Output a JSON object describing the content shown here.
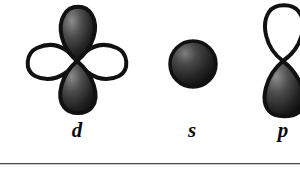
{
  "figure": {
    "background_color": "#ffffff",
    "outline_color": "#111111",
    "fill_dark_color": "#1a1a1a",
    "fill_light_color": "#ffffff",
    "rule_color": "#4a4a4a",
    "orbitals": [
      {
        "id": "d-orbital",
        "label": "d",
        "shape": "four-lobe-clover",
        "lobe_count": 4,
        "lobes": [
          {
            "direction": "up",
            "fill": "dark"
          },
          {
            "direction": "down",
            "fill": "dark"
          },
          {
            "direction": "left",
            "fill": "light"
          },
          {
            "direction": "right",
            "fill": "light"
          }
        ],
        "center_x": 77,
        "center_y": 61,
        "label_x": 77,
        "label_y": 130
      },
      {
        "id": "s-orbital",
        "label": "s",
        "shape": "sphere",
        "lobe_count": 1,
        "lobes": [
          {
            "direction": "radial",
            "fill": "dark"
          }
        ],
        "center_x": 192,
        "center_y": 64,
        "radius": 24,
        "label_x": 192,
        "label_y": 130
      },
      {
        "id": "p-orbital",
        "label": "p",
        "shape": "two-lobe-dumbbell",
        "lobe_count": 2,
        "lobes": [
          {
            "direction": "up",
            "fill": "light"
          },
          {
            "direction": "down",
            "fill": "dark"
          }
        ],
        "center_x": 283,
        "center_y": 61,
        "label_x": 283,
        "label_y": 130
      }
    ],
    "rule": {
      "y": 163,
      "thickness": 1
    }
  }
}
